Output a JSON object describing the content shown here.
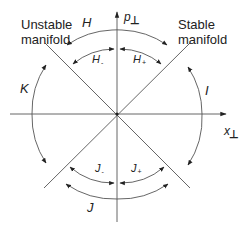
{
  "figure": {
    "axes": {
      "vertical_label": "p",
      "vertical_subscript": "⊥",
      "horizontal_label": "x",
      "horizontal_subscript": "⊥"
    },
    "manifolds": {
      "unstable": "Unstable manifold",
      "stable": "Stable manifold"
    },
    "regions": {
      "H": "H",
      "H_minus": "H",
      "H_minus_sub": "-",
      "H_plus": "H",
      "H_plus_sub": "+",
      "I": "I",
      "J": "J",
      "J_minus": "J",
      "J_minus_sub": "-",
      "J_plus": "J",
      "J_plus_sub": "+",
      "K": "K"
    },
    "colors": {
      "line": "#555555",
      "arrow": "#222222",
      "text": "#222222"
    }
  }
}
